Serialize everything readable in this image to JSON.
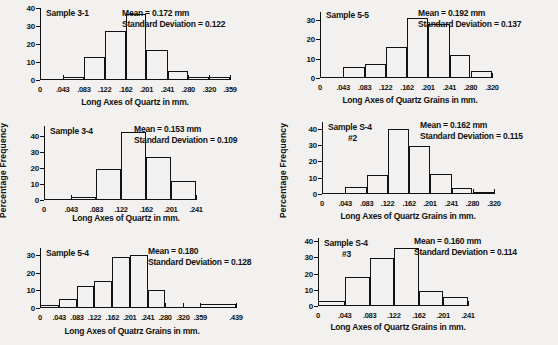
{
  "figure": {
    "background_color": "#f2f1ef",
    "ink_color": "#111111",
    "panel_count": 6
  },
  "chart_data": [
    {
      "id": "sample-3-1",
      "type": "bar",
      "title": "Sample 3-1",
      "subtitle": "",
      "xlabel": "Long Axes of Quartz in mm.",
      "ylabel": "",
      "mean_label": "Mean = 0.172 mm",
      "sd_label": "Standard Deviation = 0.122",
      "mean": 0.172,
      "standard_deviation": 0.122,
      "unit": "mm",
      "grid": false,
      "legend": "none",
      "ylim": [
        0,
        40
      ],
      "yticks": [
        0,
        10,
        20,
        30,
        40
      ],
      "ytick_labels": [
        "0",
        "10",
        "20",
        "30",
        "40"
      ],
      "bin_edges": [
        0,
        0.043,
        0.083,
        0.122,
        0.162,
        0.201,
        0.241,
        0.28,
        0.32,
        0.359
      ],
      "xtick_labels": [
        "0",
        ".043",
        ".083",
        ".122",
        ".162",
        ".201",
        ".241",
        ".280",
        ".320",
        ".359"
      ],
      "values": [
        0,
        1.5,
        13,
        27,
        36.5,
        16.5,
        5,
        1.5,
        1.5
      ]
    },
    {
      "id": "sample-5-5",
      "type": "bar",
      "title": "Sample 5-5",
      "subtitle": "",
      "xlabel": "Long Axes of Quartz Grains in mm.",
      "ylabel": "",
      "mean_label": "Mean = 0.192 mm",
      "sd_label": "Standard Deviation = 0.137",
      "mean": 0.192,
      "standard_deviation": 0.137,
      "unit": "mm",
      "grid": false,
      "legend": "none",
      "ylim": [
        0,
        34
      ],
      "yticks": [
        0,
        10,
        20,
        30
      ],
      "ytick_labels": [
        "0",
        "10",
        "20",
        "30"
      ],
      "bin_edges": [
        0,
        0.043,
        0.083,
        0.122,
        0.162,
        0.201,
        0.241,
        0.28,
        0.32
      ],
      "xtick_labels": [
        "0",
        ".043",
        ".083",
        ".122",
        ".162",
        ".201",
        ".241",
        ".280",
        ".320"
      ],
      "values": [
        0,
        5.5,
        7,
        16,
        31,
        28,
        12,
        3.5
      ]
    },
    {
      "id": "sample-3-4",
      "type": "bar",
      "title": "Sample 3-4",
      "subtitle": "",
      "xlabel": "Long Axes of Quartz in mm.",
      "ylabel": "Percentage Frequency",
      "mean_label": "Mean = 0.153 mm",
      "sd_label": "Standard Deviation = 0.109",
      "mean": 0.153,
      "standard_deviation": 0.109,
      "unit": "mm",
      "grid": false,
      "legend": "none",
      "ylim": [
        0,
        46
      ],
      "yticks": [
        0,
        10,
        20,
        30,
        40
      ],
      "ytick_labels": [
        "0",
        "10",
        "20",
        "30",
        "40"
      ],
      "bin_edges": [
        0,
        0.043,
        0.083,
        0.122,
        0.162,
        0.201,
        0.241
      ],
      "xtick_labels": [
        "0",
        ".043",
        ".083",
        ".122",
        ".162",
        ".201",
        ".241"
      ],
      "values": [
        0,
        2,
        19.5,
        42.5,
        26.5,
        12
      ]
    },
    {
      "id": "sample-s-4-2",
      "type": "bar",
      "title": "Sample S-4",
      "subtitle": "#2",
      "xlabel": "Long Axes of Quartz Grains in mm.",
      "ylabel": "Percentage Frequency",
      "mean_label": "Mean = 0.162 mm",
      "sd_label": "Standard Deviation = 0.115",
      "mean": 0.162,
      "standard_deviation": 0.115,
      "unit": "mm",
      "grid": false,
      "legend": "none",
      "ylim": [
        0,
        44
      ],
      "yticks": [
        0,
        10,
        20,
        30,
        40
      ],
      "ytick_labels": [
        "0",
        "10",
        "20",
        "30",
        "40"
      ],
      "bin_edges": [
        0,
        0.043,
        0.083,
        0.122,
        0.162,
        0.201,
        0.241,
        0.28,
        0.32
      ],
      "xtick_labels": [
        "0",
        ".043",
        ".083",
        ".122",
        ".162",
        ".201",
        ".241",
        ".280",
        ".320"
      ],
      "values": [
        0,
        4.5,
        11.5,
        40,
        29.5,
        12,
        3.5,
        1.5
      ]
    },
    {
      "id": "sample-5-4",
      "type": "bar",
      "title": "Sample 5-4",
      "subtitle": "",
      "xlabel": "Long Axes of Quatrz Grains in mm.",
      "ylabel": "",
      "mean_label": "Mean = 0.180",
      "sd_label": "Standard Deviation = 0.128",
      "mean": 0.18,
      "standard_deviation": 0.128,
      "unit": "mm",
      "grid": false,
      "legend": "none",
      "ylim": [
        0,
        34
      ],
      "yticks": [
        0,
        10,
        20,
        30
      ],
      "ytick_labels": [
        "0",
        "10",
        "20",
        "30"
      ],
      "bin_edges": [
        0,
        0.043,
        0.083,
        0.122,
        0.162,
        0.201,
        0.241,
        0.28,
        0.32,
        0.359,
        0.439
      ],
      "xtick_labels": [
        "0",
        ".043",
        ".083",
        ".122",
        ".162",
        ".201",
        ".241",
        ".280",
        ".320",
        ".359",
        ".439"
      ],
      "values": [
        1.5,
        5,
        12.5,
        15.5,
        29,
        30,
        10,
        0,
        0,
        2
      ]
    },
    {
      "id": "sample-s-4-3",
      "type": "bar",
      "title": "Sample S-4",
      "subtitle": "#3",
      "xlabel": "Long Axes of Quartz Grains in mm.",
      "ylabel": "",
      "mean_label": "Mean = 0.160 mm",
      "sd_label": "Standard Deviation = 0.114",
      "mean": 0.16,
      "standard_deviation": 0.114,
      "unit": "mm",
      "grid": false,
      "legend": "none",
      "ylim": [
        0,
        42
      ],
      "yticks": [
        0,
        10,
        20,
        30,
        40
      ],
      "ytick_labels": [
        "0",
        "10",
        "20",
        "30",
        "40"
      ],
      "bin_edges": [
        0,
        0.043,
        0.083,
        0.122,
        0.162,
        0.201,
        0.241
      ],
      "xtick_labels": [
        "0",
        ".043",
        ".083",
        ".122",
        ".162",
        ".201",
        ".241"
      ],
      "values": [
        3,
        18,
        29.5,
        36,
        9.5,
        5.5
      ]
    }
  ]
}
